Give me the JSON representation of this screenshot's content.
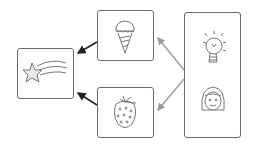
{
  "diagram": {
    "type": "flow",
    "nodes": [
      {
        "id": "source",
        "icons": [
          "lightbulb",
          "girl-face"
        ],
        "label": "Idea + Person"
      },
      {
        "id": "ice-cream",
        "icons": [
          "ice-cream-cone"
        ],
        "label": "Ice cream"
      },
      {
        "id": "strawberry",
        "icons": [
          "strawberry"
        ],
        "label": "Strawberry"
      },
      {
        "id": "star",
        "icons": [
          "shooting-star"
        ],
        "label": "Shooting star"
      }
    ],
    "edges": [
      {
        "from": "source",
        "to": "ice-cream",
        "color": "#999999"
      },
      {
        "from": "source",
        "to": "strawberry",
        "color": "#999999"
      },
      {
        "from": "ice-cream",
        "to": "star",
        "color": "#222222"
      },
      {
        "from": "strawberry",
        "to": "star",
        "color": "#222222"
      }
    ],
    "colors": {
      "box_border": "#6a6a6a",
      "icon_stroke": "#777777",
      "gray_arrow": "#999999",
      "black_arrow": "#222222"
    }
  }
}
